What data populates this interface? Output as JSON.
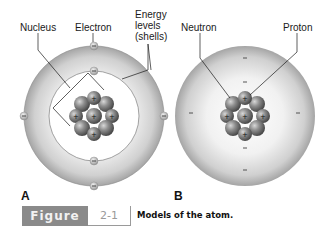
{
  "labels": {
    "nucleus": "Nucleus",
    "electron": "Electron",
    "energy_levels_1": "Energy",
    "energy_levels_2": "levels",
    "energy_levels_3": "(shells)",
    "neutron": "Neutron",
    "proton": "Proton"
  },
  "panels": {
    "a": "A",
    "b": "B"
  },
  "figure": {
    "label": "Figure",
    "number": "2-1",
    "caption": "Models of the atom."
  },
  "symbols": {
    "electron_charge": "−",
    "proton_charge": "+"
  },
  "colors": {
    "sphere_outer": "#a9a9a9",
    "sphere_inner": "#f4f4f4",
    "nucleon": "#6e6e6e",
    "figure_box": "#8a8a8a"
  }
}
